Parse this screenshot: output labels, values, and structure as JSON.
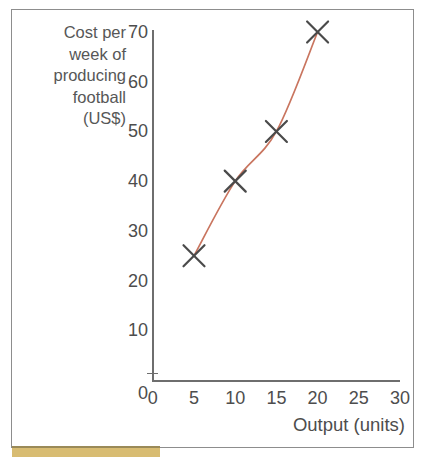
{
  "page": {
    "background_color": "#ffffff",
    "frame_color": "#8d8d8d",
    "bottom_strip_color": "#d8bc72"
  },
  "chart_data": {
    "type": "line",
    "title": "",
    "subtitle": "",
    "xlabel": "Output (units)",
    "ylabel": "Cost per week of producing football (US$)",
    "ylabel_lines": [
      "Cost per",
      "week of",
      "producing",
      "football",
      "(US$)"
    ],
    "x": [
      5,
      10,
      15,
      20
    ],
    "values": [
      25,
      40,
      50,
      70
    ],
    "points": [
      {
        "x": 5,
        "y": 25
      },
      {
        "x": 10,
        "y": 40
      },
      {
        "x": 15,
        "y": 50
      },
      {
        "x": 20,
        "y": 70
      }
    ],
    "xlim": [
      0,
      30
    ],
    "ylim": [
      0,
      70
    ],
    "x_ticks": [
      0,
      5,
      10,
      15,
      20,
      25,
      30
    ],
    "y_ticks": [
      0,
      10,
      20,
      30,
      40,
      50,
      60,
      70
    ],
    "x_tick_labels": [
      "0",
      "5",
      "10",
      "15",
      "20",
      "25",
      "30"
    ],
    "y_tick_labels": [
      "0",
      "10",
      "20",
      "30",
      "40",
      "50",
      "60",
      "70"
    ],
    "grid": false,
    "legend": null,
    "legend_position": "none",
    "marker": "x",
    "marker_color": "#4a4a4a",
    "line_color": "#c9755f",
    "axis_color": "#6e6e6e",
    "tick_label_color": "#4d4d4d",
    "axis_title_color": "#4d4d4d"
  }
}
